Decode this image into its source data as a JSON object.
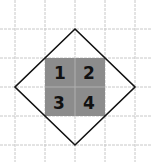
{
  "diagram": {
    "cells": [
      {
        "label": "1",
        "col": 0,
        "row": 0
      },
      {
        "label": "2",
        "col": 1,
        "row": 0
      },
      {
        "label": "3",
        "col": 0,
        "row": 1
      },
      {
        "label": "4",
        "col": 1,
        "row": 1
      }
    ],
    "colors": {
      "grid": "#c8c8c8",
      "fill": "#8c8c8c",
      "outline": "#111111",
      "background": "#ffffff"
    }
  }
}
